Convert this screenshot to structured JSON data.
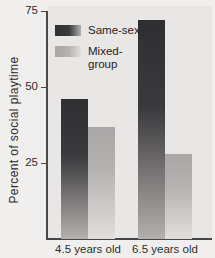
{
  "figure": {
    "background": "#f1efed",
    "plot_background": "#e9e7e6",
    "axis_color": "#4a4a4a",
    "text_color": "#2d2d2d"
  },
  "chart_data": {
    "type": "bar",
    "title": "",
    "xlabel": "",
    "ylabel": "Percent of social playtime",
    "categories": [
      "4.5 years old",
      "6.5 years old"
    ],
    "series": [
      {
        "name": "Same-sex",
        "values": [
          46,
          72
        ],
        "color_top": "#2f2f31",
        "color_mid": "#3a393b",
        "color_bottom": "#b3b1af"
      },
      {
        "name": "Mixed-group",
        "values": [
          37,
          28
        ],
        "color_top": "#a8a6a6",
        "color_mid": "#b6b4b2",
        "color_bottom": "#e1dfdd"
      }
    ],
    "ylim": [
      0,
      75
    ],
    "yticks": [
      25,
      50,
      75
    ],
    "grid": false,
    "legend_position": "top-left"
  }
}
